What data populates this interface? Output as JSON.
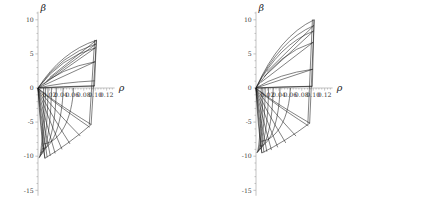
{
  "figure": {
    "title": "",
    "panel_count": 2,
    "background": "#ffffff",
    "curve_color": "#1a1a1a",
    "axis_color": "#aaaaaa"
  },
  "chart_data": [
    {
      "type": "line",
      "panel": "left",
      "title": "",
      "xlabel": "ρ",
      "ylabel": "β",
      "xlim": [
        -0.004,
        0.134
      ],
      "ylim": [
        -15.8,
        11.2
      ],
      "xticks": [
        0.02,
        0.04,
        0.06,
        0.08,
        0.1,
        0.12
      ],
      "xticklabels": [
        "0.02",
        "0.04",
        "0.06",
        "0.08",
        "0.10",
        "0.12"
      ],
      "yticks": [
        10,
        5,
        0,
        -5,
        -10,
        -15
      ],
      "yticklabels": [
        "10",
        "5",
        "0",
        "-5",
        "-10",
        "-15"
      ],
      "grid": false,
      "legend": null,
      "description": "Curvilinear net of characteristic curves fanning from the origin; upper family rises to beta ~ 7 near rho ~ 0.102, lower family descends to beta ~ -10.3 near rho ~ 0.012, closed on the right by a near-vertical envelope at rho ~ 0.100.",
      "origin": [
        0.0,
        0.0
      ],
      "rays_upper": [
        {
          "name": "u1",
          "end": [
            0.102,
            7.0
          ]
        },
        {
          "name": "u2",
          "end": [
            0.1012,
            6.45
          ]
        },
        {
          "name": "u3",
          "end": [
            0.1005,
            5.9
          ]
        },
        {
          "name": "u4",
          "end": [
            0.0998,
            3.85
          ]
        },
        {
          "name": "u5",
          "end": [
            0.0992,
            1.05
          ]
        },
        {
          "name": "u6",
          "end": [
            0.0988,
            0.3
          ]
        }
      ],
      "rays_lower": [
        {
          "name": "l1",
          "end": [
            0.093,
            -5.35
          ]
        },
        {
          "name": "l2",
          "end": [
            0.0905,
            -5.75
          ]
        },
        {
          "name": "l3",
          "end": [
            0.074,
            -7.05
          ]
        },
        {
          "name": "l4",
          "end": [
            0.056,
            -8.2
          ]
        },
        {
          "name": "l5",
          "end": [
            0.042,
            -9.0
          ]
        },
        {
          "name": "l6",
          "end": [
            0.03,
            -9.6
          ]
        },
        {
          "name": "l7",
          "end": [
            0.0215,
            -9.95
          ]
        },
        {
          "name": "l8",
          "end": [
            0.016,
            -10.15
          ]
        },
        {
          "name": "l9",
          "end": [
            0.012,
            -10.3
          ]
        }
      ],
      "arcs": [
        {
          "name": "a1",
          "x_at_zero": 0.062,
          "y_bottom": -8.2
        },
        {
          "name": "a2",
          "x_at_zero": 0.044,
          "y_bottom": -8.95
        },
        {
          "name": "a3",
          "x_at_zero": 0.032,
          "y_bottom": -9.45
        },
        {
          "name": "a4",
          "x_at_zero": 0.0235,
          "y_bottom": -9.85
        },
        {
          "name": "a5",
          "x_at_zero": 0.0175,
          "y_bottom": -10.05
        },
        {
          "name": "a6",
          "x_at_zero": 0.013,
          "y_bottom": -10.2
        },
        {
          "name": "a7",
          "x_at_zero": 0.0098,
          "y_bottom": -10.28
        }
      ],
      "crosslines_upper": [
        {
          "name": "c1",
          "from": [
            0.0,
            0.0
          ],
          "to": [
            0.0992,
            0.3
          ]
        },
        {
          "name": "c2",
          "from": [
            0.0,
            0.0
          ],
          "to": [
            0.0998,
            3.85
          ]
        },
        {
          "name": "c3",
          "from": [
            0.0095,
            0.55
          ],
          "to": [
            0.1005,
            5.9
          ]
        },
        {
          "name": "c4",
          "from": [
            0.015,
            1.05
          ],
          "to": [
            0.1012,
            6.45
          ]
        },
        {
          "name": "c5",
          "from": [
            0.0205,
            1.55
          ],
          "to": [
            0.102,
            7.0
          ]
        }
      ],
      "right_envelope": {
        "top": [
          0.1022,
          7.05
        ],
        "bottom": [
          0.0928,
          -5.4
        ]
      },
      "bottom_envelope": {
        "left": [
          0.0118,
          -10.32
        ],
        "right": [
          0.093,
          -5.35
        ]
      }
    },
    {
      "type": "line",
      "panel": "right",
      "title": "",
      "xlabel": "ρ",
      "ylabel": "β",
      "xlim": [
        -0.004,
        0.134
      ],
      "ylim": [
        -15.8,
        11.2
      ],
      "xticks": [
        0.02,
        0.04,
        0.06,
        0.08,
        0.1,
        0.12
      ],
      "xticklabels": [
        "0.02",
        "0.04",
        "0.06",
        "0.08",
        "0.10",
        "0.12"
      ],
      "yticks": [
        10,
        5,
        0,
        -5,
        -10,
        -15
      ],
      "yticklabels": [
        "10",
        "5",
        "0",
        "-5",
        "-10",
        "-15"
      ],
      "grid": false,
      "legend": null,
      "description": "Companion panel with the same curvilinear net; upper family reaches beta ~ 10 near rho ~ 0.101 and the lower family bottoms near beta ~ -9.5 at rho ~ 0.010.",
      "origin": [
        0.0,
        0.0
      ],
      "rays_upper": [
        {
          "name": "u1",
          "end": [
            0.1015,
            10.0
          ]
        },
        {
          "name": "u2",
          "end": [
            0.101,
            9.15
          ]
        },
        {
          "name": "u3",
          "end": [
            0.1005,
            8.35
          ]
        },
        {
          "name": "u4",
          "end": [
            0.1,
            6.7
          ]
        },
        {
          "name": "u5",
          "end": [
            0.0992,
            2.75
          ]
        },
        {
          "name": "u6",
          "end": [
            0.0985,
            0.25
          ]
        }
      ],
      "rays_lower": [
        {
          "name": "l1",
          "end": [
            0.094,
            -5.15
          ]
        },
        {
          "name": "l2",
          "end": [
            0.0915,
            -5.55
          ]
        },
        {
          "name": "l3",
          "end": [
            0.07,
            -7.05
          ]
        },
        {
          "name": "l4",
          "end": [
            0.052,
            -8.05
          ]
        },
        {
          "name": "l5",
          "end": [
            0.038,
            -8.7
          ]
        },
        {
          "name": "l6",
          "end": [
            0.027,
            -9.1
          ]
        },
        {
          "name": "l7",
          "end": [
            0.019,
            -9.35
          ]
        },
        {
          "name": "l8",
          "end": [
            0.014,
            -9.45
          ]
        },
        {
          "name": "l9",
          "end": [
            0.0102,
            -9.52
          ]
        }
      ],
      "arcs": [
        {
          "name": "a1",
          "x_at_zero": 0.06,
          "y_bottom": -7.8
        },
        {
          "name": "a2",
          "x_at_zero": 0.042,
          "y_bottom": -8.55
        },
        {
          "name": "a3",
          "x_at_zero": 0.03,
          "y_bottom": -9.0
        },
        {
          "name": "a4",
          "x_at_zero": 0.022,
          "y_bottom": -9.25
        },
        {
          "name": "a5",
          "x_at_zero": 0.016,
          "y_bottom": -9.4
        },
        {
          "name": "a6",
          "x_at_zero": 0.012,
          "y_bottom": -9.48
        },
        {
          "name": "a7",
          "x_at_zero": 0.009,
          "y_bottom": -9.51
        }
      ],
      "crosslines_upper": [
        {
          "name": "c1",
          "from": [
            0.0,
            0.0
          ],
          "to": [
            0.0985,
            0.25
          ]
        },
        {
          "name": "c2",
          "from": [
            0.0,
            0.0
          ],
          "to": [
            0.0992,
            2.75
          ]
        },
        {
          "name": "c3",
          "from": [
            0.009,
            0.85
          ],
          "to": [
            0.1,
            6.7
          ]
        },
        {
          "name": "c4",
          "from": [
            0.014,
            1.65
          ],
          "to": [
            0.1005,
            8.35
          ]
        },
        {
          "name": "c5",
          "from": [
            0.019,
            2.4
          ],
          "to": [
            0.101,
            9.15
          ]
        }
      ],
      "right_envelope": {
        "top": [
          0.1018,
          10.05
        ],
        "bottom": [
          0.0938,
          -5.2
        ]
      },
      "bottom_envelope": {
        "left": [
          0.01,
          -9.54
        ],
        "right": [
          0.094,
          -5.15
        ]
      }
    }
  ]
}
